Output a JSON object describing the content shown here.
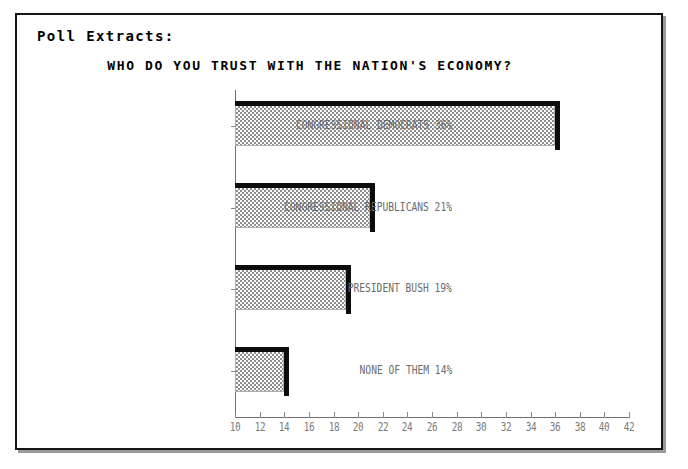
{
  "panel": {
    "title": "Poll Extracts:"
  },
  "chart_data": {
    "type": "bar",
    "orientation": "horizontal",
    "title": "WHO DO YOU TRUST WITH THE NATION'S ECONOMY?",
    "xlabel": "",
    "ylabel": "",
    "categories": [
      "CONGRESSIONAL DEMOCRATS",
      "CONGRESSIONAL REPUBLICANS",
      "PRESIDENT BUSH",
      "NONE OF THEM"
    ],
    "category_labels": [
      "CONGRESSIONAL DEMOCRATS 36%",
      "CONGRESSIONAL REPUBLICANS 21%",
      "PRESIDENT BUSH 19%",
      "NONE OF THEM 14%"
    ],
    "values": [
      36,
      21,
      19,
      14
    ],
    "value_suffix": "%",
    "xlim": [
      10,
      42
    ],
    "xticks": [
      10,
      12,
      14,
      16,
      18,
      20,
      22,
      24,
      26,
      28,
      30,
      32,
      34,
      36,
      38,
      40,
      42
    ],
    "grid": false,
    "legend": false,
    "colors": {
      "bar_fill": "#8d8d8d",
      "bar_edge": "#0d0d0d",
      "axis": "#6f6f6f",
      "tick_text": "#7a7a7a",
      "label_text": "#6b6b6b",
      "frame": "#151515",
      "background": "#ffffff"
    }
  }
}
